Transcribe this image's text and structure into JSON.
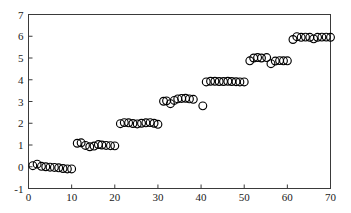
{
  "chart_data": {
    "type": "scatter",
    "title": "",
    "xlabel": "",
    "ylabel": "",
    "xlim": [
      0,
      70
    ],
    "ylim": [
      -1,
      7
    ],
    "xticks": [
      0,
      10,
      20,
      30,
      40,
      50,
      60,
      70
    ],
    "yticks": [
      -1,
      0,
      1,
      2,
      3,
      4,
      5,
      6,
      7
    ],
    "xtick_labels": [
      "0",
      "10",
      "20",
      "30",
      "40",
      "50",
      "60",
      "70"
    ],
    "ytick_labels": [
      "-1",
      "0",
      "1",
      "2",
      "3",
      "4",
      "5",
      "6",
      "7"
    ],
    "grid": false,
    "legend": null,
    "marker": "open-circle",
    "marker_color": "#000000",
    "marker_fill": "none",
    "marker_size": 5.4,
    "series": [
      {
        "name": "staircase",
        "points": [
          [
            1.0,
            0.05
          ],
          [
            2.0,
            0.12
          ],
          [
            3.0,
            0.02
          ],
          [
            4.0,
            0.0
          ],
          [
            5.0,
            -0.02
          ],
          [
            6.0,
            -0.03
          ],
          [
            7.0,
            -0.05
          ],
          [
            8.0,
            -0.08
          ],
          [
            9.0,
            -0.1
          ],
          [
            10.0,
            -0.1
          ],
          [
            11.3,
            1.08
          ],
          [
            12.2,
            1.1
          ],
          [
            13.2,
            0.98
          ],
          [
            14.2,
            0.92
          ],
          [
            15.2,
            0.95
          ],
          [
            16.2,
            1.02
          ],
          [
            17.0,
            1.0
          ],
          [
            18.0,
            0.98
          ],
          [
            19.0,
            0.97
          ],
          [
            20.0,
            0.96
          ],
          [
            21.3,
            1.98
          ],
          [
            22.2,
            2.03
          ],
          [
            23.2,
            2.02
          ],
          [
            24.2,
            1.99
          ],
          [
            25.2,
            1.97
          ],
          [
            26.2,
            2.0
          ],
          [
            27.2,
            2.02
          ],
          [
            28.2,
            2.03
          ],
          [
            29.1,
            2.0
          ],
          [
            30.0,
            1.95
          ],
          [
            31.3,
            3.01
          ],
          [
            32.0,
            3.03
          ],
          [
            32.9,
            2.9
          ],
          [
            33.8,
            3.05
          ],
          [
            34.6,
            3.12
          ],
          [
            35.5,
            3.14
          ],
          [
            36.4,
            3.15
          ],
          [
            37.3,
            3.12
          ],
          [
            38.2,
            3.1
          ],
          [
            40.4,
            2.8
          ],
          [
            41.2,
            3.9
          ],
          [
            42.2,
            3.93
          ],
          [
            43.2,
            3.93
          ],
          [
            44.2,
            3.92
          ],
          [
            45.2,
            3.92
          ],
          [
            46.2,
            3.93
          ],
          [
            47.1,
            3.92
          ],
          [
            48.1,
            3.91
          ],
          [
            49.0,
            3.9
          ],
          [
            50.0,
            3.9
          ],
          [
            51.3,
            4.87
          ],
          [
            52.2,
            5.0
          ],
          [
            53.1,
            5.02
          ],
          [
            54.0,
            5.0
          ],
          [
            55.2,
            5.02
          ],
          [
            56.2,
            4.74
          ],
          [
            57.2,
            4.86
          ],
          [
            58.2,
            4.88
          ],
          [
            59.1,
            4.87
          ],
          [
            60.0,
            4.87
          ],
          [
            61.3,
            5.85
          ],
          [
            62.2,
            5.98
          ],
          [
            63.2,
            5.95
          ],
          [
            64.2,
            5.96
          ],
          [
            65.2,
            5.95
          ],
          [
            66.1,
            5.88
          ],
          [
            67.0,
            5.95
          ],
          [
            68.0,
            5.96
          ],
          [
            69.0,
            5.96
          ],
          [
            70.0,
            5.95
          ]
        ]
      }
    ]
  },
  "axes": {
    "frame_color": "#3a3a3a",
    "background": "#ffffff"
  }
}
